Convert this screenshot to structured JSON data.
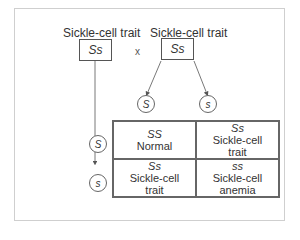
{
  "parents": [
    {
      "label": "Sickle-cell trait",
      "genotype": "Ss"
    },
    {
      "label": "Sickle-cell trait",
      "genotype": "Ss"
    }
  ],
  "cross_symbol": "x",
  "gametes": {
    "top": [
      "S",
      "s"
    ],
    "left": [
      "S",
      "s"
    ]
  },
  "punnett": [
    {
      "genotype": "SS",
      "phenotype": "Normal"
    },
    {
      "genotype": "Ss",
      "phenotype": "Sickle-cell trait"
    },
    {
      "genotype": "Ss",
      "phenotype": "Sickle-cell trait"
    },
    {
      "genotype": "ss",
      "phenotype": "Sickle-cell anemia"
    }
  ]
}
